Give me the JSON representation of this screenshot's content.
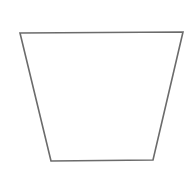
{
  "diagram": {
    "shape": "trapezoid",
    "fill": "none",
    "stroke_color": "#6b6b6b",
    "background_color": "#ffffff",
    "edges": [
      {
        "name": "top-edge"
      },
      {
        "name": "right-edge"
      },
      {
        "name": "bottom-edge"
      },
      {
        "name": "left-edge"
      }
    ]
  }
}
